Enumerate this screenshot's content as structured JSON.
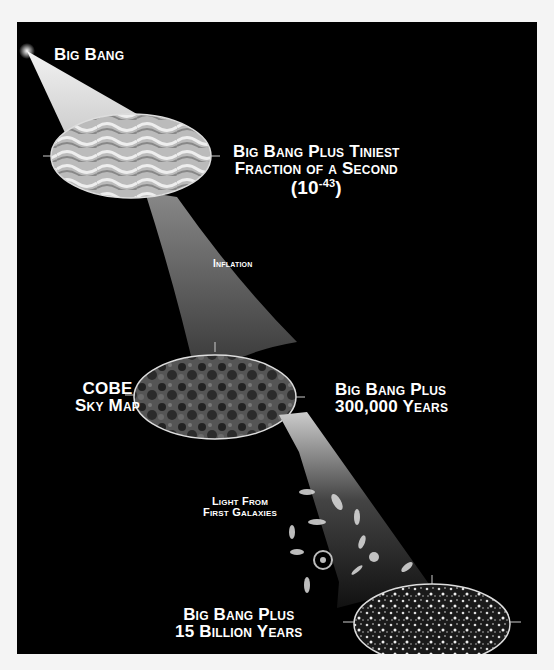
{
  "diagram": {
    "type": "cosmic-timeline",
    "background_color": "#000000",
    "stages": [
      {
        "id": "big-bang",
        "label_lines": [
          "Big Bang"
        ]
      },
      {
        "id": "tiniest-fraction",
        "label_lines": [
          "Big Bang Plus Tiniest",
          "Fraction of a Second"
        ],
        "exponent_base": "(10",
        "exponent": "-43",
        "exponent_close": ")"
      },
      {
        "id": "inflation",
        "label_lines": [
          "Inflation"
        ]
      },
      {
        "id": "cobe",
        "left_label_lines": [
          "COBE",
          "Sky Map"
        ],
        "label_lines": [
          "Big Bang Plus",
          "300,000 Years"
        ]
      },
      {
        "id": "first-galaxies",
        "label_lines": [
          "Light From",
          "First Galaxies"
        ]
      },
      {
        "id": "present",
        "label_lines": [
          "Big Bang Plus",
          "15 Billion Years"
        ]
      }
    ]
  }
}
